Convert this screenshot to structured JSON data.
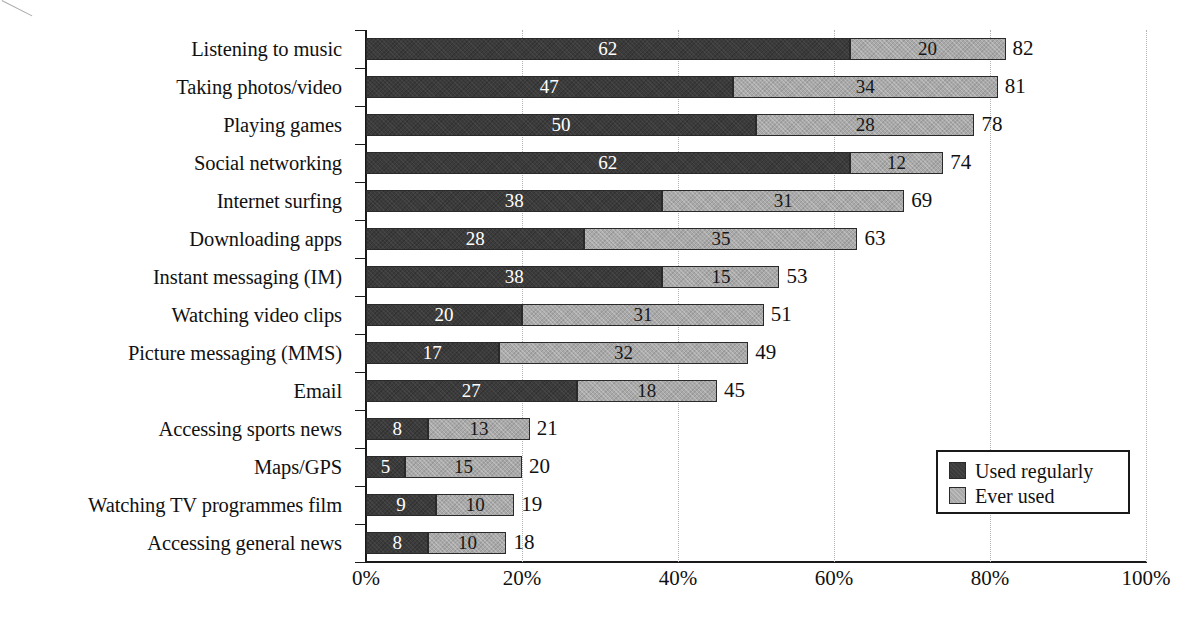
{
  "chart_data": {
    "type": "bar",
    "subtype": "stacked-horizontal",
    "title": "",
    "subtitle": "",
    "xlabel": "",
    "ylabel": "",
    "xlim": [
      0,
      100
    ],
    "xtick_labels": [
      "0%",
      "20%",
      "40%",
      "60%",
      "80%",
      "100%"
    ],
    "xtick_values": [
      0,
      20,
      40,
      60,
      80,
      100
    ],
    "grid": "vertical-dotted",
    "legend_position": "bottom-right",
    "categories": [
      "Listening to music",
      "Taking photos/video",
      "Playing games",
      "Social networking",
      "Internet surfing",
      "Downloading apps",
      "Instant messaging (IM)",
      "Watching video clips",
      "Picture messaging (MMS)",
      "Email",
      "Accessing sports news",
      "Maps/GPS",
      "Watching TV programmes film",
      "Accessing general news"
    ],
    "series": [
      {
        "name": "Used regularly",
        "color": "#3b3b3b",
        "values": [
          62,
          47,
          50,
          62,
          38,
          28,
          38,
          20,
          17,
          27,
          8,
          5,
          9,
          8
        ]
      },
      {
        "name": "Ever used",
        "color": "#a9a9a9",
        "values": [
          20,
          34,
          28,
          12,
          31,
          35,
          15,
          31,
          32,
          18,
          13,
          15,
          10,
          10
        ]
      }
    ],
    "totals": [
      82,
      81,
      78,
      74,
      69,
      63,
      53,
      51,
      49,
      45,
      21,
      20,
      19,
      18
    ]
  },
  "legend": {
    "items": [
      {
        "label": "Used regularly",
        "color": "#3b3b3b"
      },
      {
        "label": "Ever used",
        "color": "#a9a9a9"
      }
    ]
  },
  "colors": {
    "used_regularly": "#3b3b3b",
    "ever_used": "#a9a9a9",
    "axis": "#1a1a1a",
    "gridline": "#b4b4b4",
    "background": "#ffffff"
  }
}
